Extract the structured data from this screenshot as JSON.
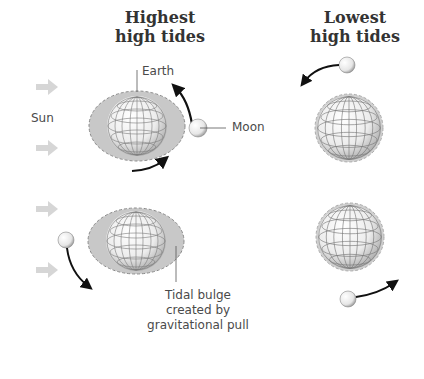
{
  "columns": {
    "highest": {
      "title_line1": "Highest",
      "title_line2": "high tides"
    },
    "lowest": {
      "title_line1": "Lowest",
      "title_line2": "high tides"
    }
  },
  "labels": {
    "sun": "Sun",
    "earth": "Earth",
    "moon": "Moon",
    "bulge_line1": "Tidal bulge",
    "bulge_line2": "created by",
    "bulge_line3": "gravitational pull"
  },
  "colors": {
    "sun_arrow": "#d6d6d6",
    "globe_fill": "#f2f2f2",
    "globe_grid": "#7a7a7a",
    "bulge": "#bdbdbd",
    "orbit_arrow": "#111111",
    "text": "#4a4a4a"
  }
}
